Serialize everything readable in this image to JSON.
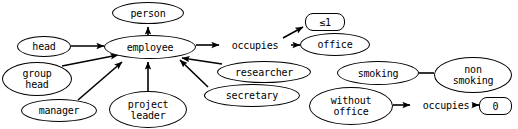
{
  "diagram": {
    "style": {
      "stroke": "#000000",
      "fill": "#ffffff",
      "text": "#000000"
    },
    "nodes": [
      {
        "id": "person",
        "label": "person",
        "shape": "ellipse",
        "x": 112,
        "y": 2,
        "w": 72,
        "h": 22
      },
      {
        "id": "employee",
        "label": "employee",
        "shape": "ellipse",
        "x": 104,
        "y": 35,
        "w": 92,
        "h": 24
      },
      {
        "id": "head",
        "label": "head",
        "shape": "ellipse",
        "x": 17,
        "y": 36,
        "w": 54,
        "h": 21
      },
      {
        "id": "group-head",
        "label": "group\nhead",
        "shape": "ellipse",
        "x": 2,
        "y": 62,
        "w": 70,
        "h": 34
      },
      {
        "id": "manager",
        "label": "manager",
        "shape": "ellipse",
        "x": 21,
        "y": 99,
        "w": 76,
        "h": 23
      },
      {
        "id": "project-leader",
        "label": "project\nleader",
        "shape": "ellipse",
        "x": 109,
        "y": 91,
        "w": 78,
        "h": 37
      },
      {
        "id": "researcher",
        "label": "researcher",
        "shape": "ellipse",
        "x": 217,
        "y": 61,
        "w": 94,
        "h": 22
      },
      {
        "id": "secretary",
        "label": "secretary",
        "shape": "ellipse",
        "x": 204,
        "y": 84,
        "w": 96,
        "h": 23
      },
      {
        "id": "occupies-1",
        "label": "occupies",
        "shape": "plain",
        "x": 220,
        "y": 37,
        "w": 70,
        "h": 16
      },
      {
        "id": "office",
        "label": "office",
        "shape": "ellipse",
        "x": 300,
        "y": 33,
        "w": 70,
        "h": 23
      },
      {
        "id": "card-le-1",
        "label": "≤1",
        "shape": "rrect",
        "x": 305,
        "y": 13,
        "w": 40,
        "h": 18
      },
      {
        "id": "smoking",
        "label": "smoking",
        "shape": "ellipse",
        "x": 337,
        "y": 61,
        "w": 82,
        "h": 24
      },
      {
        "id": "non-smoking",
        "label": "non\nsmoking",
        "shape": "ellipse",
        "x": 434,
        "y": 57,
        "w": 78,
        "h": 36
      },
      {
        "id": "without-office",
        "label": "without\noffice",
        "shape": "ellipse",
        "x": 309,
        "y": 87,
        "w": 84,
        "h": 38
      },
      {
        "id": "occupies-2",
        "label": "occupies",
        "shape": "plain",
        "x": 411,
        "y": 97,
        "w": 70,
        "h": 16
      },
      {
        "id": "card-zero",
        "label": "0",
        "shape": "rrect",
        "x": 479,
        "y": 97,
        "w": 33,
        "h": 18
      }
    ],
    "edges": [
      {
        "id": "employee-isa-person",
        "from": "employee",
        "to": "person",
        "arrow": "filled"
      },
      {
        "id": "head-isa-employee",
        "from": "head",
        "to": "employee",
        "arrow": "filled"
      },
      {
        "id": "group-head-isa-employee",
        "from": "group-head",
        "to": "employee",
        "arrow": "filled"
      },
      {
        "id": "manager-isa-employee",
        "from": "manager",
        "to": "employee",
        "arrow": "filled"
      },
      {
        "id": "project-leader-isa-employee",
        "from": "project-leader",
        "to": "employee",
        "arrow": "filled"
      },
      {
        "id": "researcher-isa-employee",
        "from": "researcher",
        "to": "employee",
        "arrow": "filled"
      },
      {
        "id": "secretary-isa-employee",
        "from": "secretary",
        "to": "employee",
        "arrow": "filled"
      },
      {
        "id": "employee-occupies",
        "from": "employee",
        "to": "occupies-1",
        "arrow": "filled"
      },
      {
        "id": "occupies-office",
        "from": "occupies-1",
        "to": "office",
        "arrow": "filled"
      },
      {
        "id": "occupies-card-le-1",
        "from": "occupies-1",
        "to": "card-le-1",
        "arrow": "filled"
      },
      {
        "id": "smoking-non-smoking",
        "from": "smoking",
        "to": "non-smoking",
        "arrow": "none"
      },
      {
        "id": "without-office-occupies",
        "from": "without-office",
        "to": "occupies-2",
        "arrow": "filled"
      },
      {
        "id": "occupies2-card-zero",
        "from": "occupies-2",
        "to": "card-zero",
        "arrow": "filled"
      }
    ]
  }
}
